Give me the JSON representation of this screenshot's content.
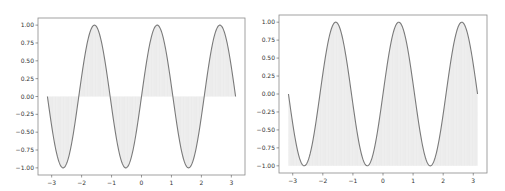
{
  "chart_data": [
    {
      "type": "area",
      "title": "",
      "xlabel": "",
      "ylabel": "",
      "function": "y = sin(3x)",
      "x_range": [
        -3.14159,
        3.14159
      ],
      "xlim": [
        -3.456,
        3.456
      ],
      "ylim": [
        -1.1,
        1.1
      ],
      "fill": "between curve and y=0",
      "grid": false,
      "x_ticks": [
        "-3",
        "-2",
        "-1",
        "0",
        "1",
        "2",
        "3"
      ],
      "y_ticks": [
        "-1.00",
        "-0.75",
        "-0.50",
        "-0.25",
        "0.00",
        "0.25",
        "0.50",
        "0.75",
        "1.00"
      ],
      "series": [
        {
          "name": "sin(3x)",
          "x": [
            -3.14,
            -2.62,
            -2.09,
            -1.57,
            -1.05,
            -0.52,
            0.0,
            0.52,
            1.05,
            1.57,
            2.09,
            2.62,
            3.14
          ],
          "values": [
            0.0,
            -1.0,
            0.0,
            1.0,
            0.0,
            -1.0,
            0.0,
            1.0,
            0.0,
            -1.0,
            0.0,
            1.0,
            0.0
          ]
        }
      ]
    },
    {
      "type": "area",
      "title": "",
      "xlabel": "",
      "ylabel": "",
      "function": "y = sin(3x)",
      "x_range": [
        -3.14159,
        3.14159
      ],
      "xlim": [
        -3.456,
        3.456
      ],
      "ylim": [
        -1.1,
        1.1
      ],
      "fill": "between curve and y=-1",
      "grid": false,
      "x_ticks": [
        "-3",
        "-2",
        "-1",
        "0",
        "1",
        "2",
        "3"
      ],
      "y_ticks": [
        "-1.00",
        "-0.75",
        "-0.50",
        "-0.25",
        "0.00",
        "0.25",
        "0.50",
        "0.75",
        "1.00"
      ],
      "series": [
        {
          "name": "sin(3x)",
          "x": [
            -3.14,
            -2.62,
            -2.09,
            -1.57,
            -1.05,
            -0.52,
            0.0,
            0.52,
            1.05,
            1.57,
            2.09,
            2.62,
            3.14
          ],
          "values": [
            0.0,
            -1.0,
            0.0,
            1.0,
            0.0,
            -1.0,
            0.0,
            1.0,
            0.0,
            -1.0,
            0.0,
            1.0,
            0.0
          ]
        }
      ]
    }
  ],
  "style": {
    "line_color": "#7a7a7a",
    "fill_color": "#f0f0f0",
    "hatch_color": "#e2e2e2",
    "axes_color": "#8a8a8a"
  },
  "axes_boxes": [
    {
      "left": 38,
      "top": 18,
      "right": 245,
      "bottom": 175
    },
    {
      "left": 279,
      "top": 15,
      "right": 487,
      "bottom": 173
    }
  ]
}
